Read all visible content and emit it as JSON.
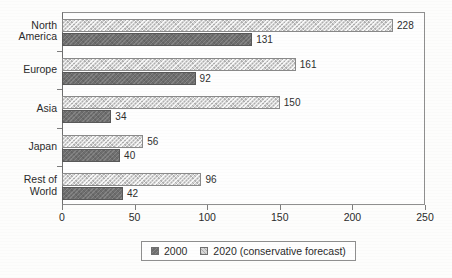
{
  "chart_data": {
    "type": "bar",
    "orientation": "horizontal",
    "title": "",
    "xlabel": "",
    "ylabel": "",
    "xlim": [
      0,
      250
    ],
    "xticks": [
      0,
      50,
      100,
      150,
      200,
      250
    ],
    "grid": false,
    "legend_position": "bottom",
    "categories": [
      "North America",
      "Europe",
      "Asia",
      "Japan",
      "Rest of World"
    ],
    "category_lines": [
      [
        "North",
        "America"
      ],
      [
        "Europe"
      ],
      [
        "Asia"
      ],
      [
        "Japan"
      ],
      [
        "Rest of",
        "World"
      ]
    ],
    "series": [
      {
        "name": "2000",
        "style": "dark",
        "values": [
          131,
          92,
          34,
          40,
          42
        ]
      },
      {
        "name": "2020 (conservative forecast)",
        "style": "light",
        "values": [
          228,
          161,
          150,
          56,
          96
        ]
      }
    ]
  },
  "legend": {
    "entries": [
      {
        "label": "2000",
        "swatch": "dark-swatch-icon"
      },
      {
        "label": "2020 (conservative forecast)",
        "swatch": "light-swatch-icon"
      }
    ]
  },
  "axis": {
    "x_tick_labels": [
      "0",
      "50",
      "100",
      "150",
      "200",
      "250"
    ]
  },
  "colors": {
    "series_2000": "#6e6e6e",
    "series_2020": "#d4d4d4",
    "axis": "#7d7d7d",
    "text": "#2b2b2b",
    "background": "#fdfdfc"
  }
}
